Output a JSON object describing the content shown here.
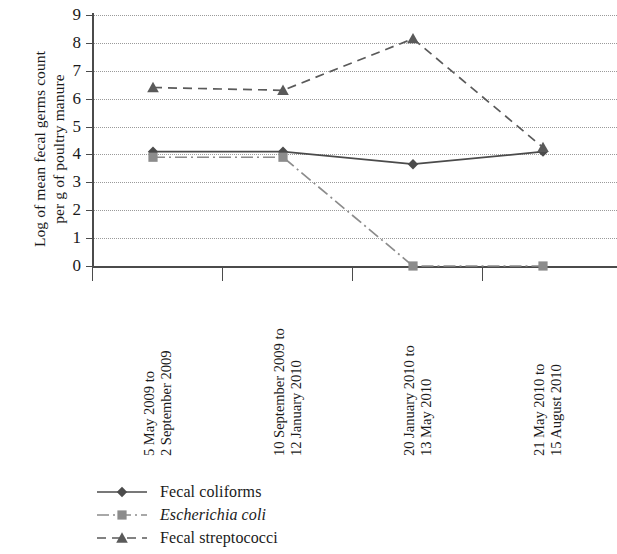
{
  "chart_data": {
    "type": "line",
    "title": "",
    "xlabel": "",
    "ylabel": "Log of mean fecal germs count per g of poultry manure",
    "ylabel_lines": [
      "Log of mean fecal germs count",
      "per g of poultry manure"
    ],
    "categories": [
      "5 May 2009 to 2 September 2009",
      "10 September 2009 to 12 January 2010",
      "20 January 2010 to 13 May 2010",
      "21 May 2010 to 15 August 2010"
    ],
    "category_lines": [
      [
        "5 May 2009 to",
        "2 September 2009"
      ],
      [
        "10 September 2009 to",
        "12 January 2010"
      ],
      [
        "20 January 2010 to",
        "13 May 2010"
      ],
      [
        "21 May 2010 to",
        "15 August 2010"
      ]
    ],
    "ylim": [
      0,
      9
    ],
    "yticks": [
      0,
      1,
      2,
      3,
      4,
      5,
      6,
      7,
      8,
      9
    ],
    "ytick_labels": [
      "0",
      "1",
      "2",
      "3",
      "4",
      "5",
      "6",
      "7",
      "8",
      "9"
    ],
    "grid": "horizontal-dotted",
    "legend_position": "bottom-left",
    "series": [
      {
        "name": "Fecal coliforms",
        "values": [
          4.1,
          4.1,
          3.65,
          4.1
        ],
        "marker": "diamond",
        "line_style": "solid",
        "color": "#4b4b4b",
        "italic": false
      },
      {
        "name": "Escherichia coli",
        "values": [
          3.9,
          3.9,
          0.0,
          0.0
        ],
        "marker": "square",
        "line_style": "dash-dot",
        "color": "#8c8c8c",
        "italic": true
      },
      {
        "name": "Fecal streptococci",
        "values": [
          6.4,
          6.3,
          8.15,
          4.25
        ],
        "marker": "triangle",
        "line_style": "dashed",
        "color": "#5a5a5a",
        "italic": false
      }
    ]
  }
}
